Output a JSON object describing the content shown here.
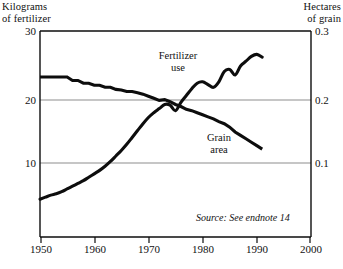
{
  "chart_data": {
    "type": "line",
    "title": "",
    "subtitle": "",
    "xlabel": "",
    "ylabel": "Kilograms\nof fertilizer",
    "y2label": "Hectares\nof grain",
    "xlim": [
      1950,
      2000
    ],
    "ylim": [
      0,
      30
    ],
    "y2lim": [
      0,
      0.3
    ],
    "grid": true,
    "grid_axis": "y",
    "legend": "inline-annotations",
    "x_ticks": [
      "1950",
      "1960",
      "1970",
      "1980",
      "1990",
      "2000"
    ],
    "x_tick_values": [
      1950,
      1960,
      1970,
      1980,
      1990,
      2000
    ],
    "y_ticks_left": [
      "10",
      "20",
      "30"
    ],
    "y_tick_values_left": [
      10,
      20,
      30
    ],
    "y_ticks_right": [
      "0.1",
      "0.2",
      "0.3"
    ],
    "y_tick_values_right": [
      0.1,
      0.2,
      0.3
    ],
    "annotations": [
      {
        "text": "Fertilizer\nuse",
        "x": 1978,
        "y": 24.5
      },
      {
        "text": "Grain\narea",
        "x": 1985,
        "y": 14.5
      },
      {
        "text": "Source: See endnote 14",
        "x": 1979,
        "y": 3.6
      }
    ],
    "series": [
      {
        "name": "Fertilizer use",
        "axis": "left",
        "unit": "kilograms of fertilizer per person",
        "x": [
          1950,
          1951,
          1952,
          1953,
          1954,
          1955,
          1956,
          1957,
          1958,
          1959,
          1960,
          1961,
          1962,
          1963,
          1964,
          1965,
          1966,
          1967,
          1968,
          1969,
          1970,
          1971,
          1972,
          1973,
          1974,
          1975,
          1976,
          1977,
          1978,
          1979,
          1980,
          1981,
          1982,
          1983,
          1984,
          1985,
          1986,
          1987,
          1988,
          1989,
          1990,
          1991
        ],
        "values": [
          5.5,
          5.8,
          6.1,
          6.3,
          6.6,
          7.0,
          7.4,
          7.8,
          8.2,
          8.7,
          9.2,
          9.7,
          10.3,
          11.0,
          11.8,
          12.6,
          13.5,
          14.5,
          15.5,
          16.5,
          17.4,
          18.1,
          18.7,
          19.3,
          19.2,
          18.4,
          19.6,
          20.6,
          21.6,
          22.4,
          22.6,
          22.2,
          21.8,
          22.6,
          24.1,
          24.4,
          23.6,
          24.9,
          25.6,
          26.3,
          26.6,
          26.2
        ]
      },
      {
        "name": "Grain area",
        "axis": "right",
        "unit": "hectares of grain per person",
        "x": [
          1950,
          1951,
          1952,
          1953,
          1954,
          1955,
          1956,
          1957,
          1958,
          1959,
          1960,
          1961,
          1962,
          1963,
          1964,
          1965,
          1966,
          1967,
          1968,
          1969,
          1970,
          1971,
          1972,
          1973,
          1974,
          1975,
          1976,
          1977,
          1978,
          1979,
          1980,
          1981,
          1982,
          1983,
          1984,
          1985,
          1986,
          1987,
          1988,
          1989,
          1990,
          1991
        ],
        "values": [
          0.233,
          0.233,
          0.233,
          0.233,
          0.233,
          0.233,
          0.228,
          0.228,
          0.224,
          0.224,
          0.221,
          0.221,
          0.218,
          0.218,
          0.215,
          0.214,
          0.212,
          0.212,
          0.21,
          0.208,
          0.205,
          0.202,
          0.199,
          0.2,
          0.197,
          0.193,
          0.19,
          0.186,
          0.184,
          0.181,
          0.178,
          0.175,
          0.172,
          0.168,
          0.165,
          0.16,
          0.153,
          0.148,
          0.143,
          0.138,
          0.133,
          0.128
        ]
      }
    ]
  },
  "figure": {
    "left_axis_title": "Kilograms\nof fertilizer",
    "right_axis_title": "Hectares\nof grain",
    "source_note": "Source: See endnote 14",
    "fertilizer_label": "Fertilizer\nuse",
    "grain_label": "Grain\narea",
    "bottom_caption": "",
    "colors": {
      "line": "#0d0d0d",
      "axis": "#0d0d0d",
      "grid": "#8d8d8d",
      "background": "#ffffff"
    }
  }
}
